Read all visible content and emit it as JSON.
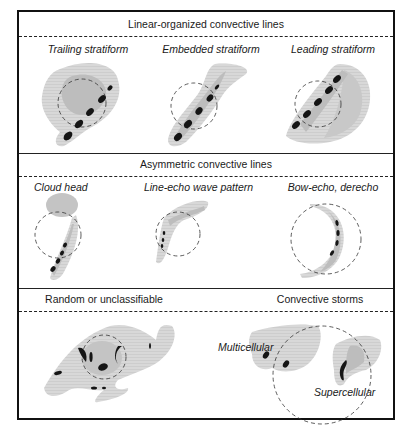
{
  "sections": [
    {
      "title": "Linear-organized convective lines",
      "panels": [
        {
          "label": "Trailing stratiform"
        },
        {
          "label": "Embedded stratiform"
        },
        {
          "label": "Leading stratiform"
        }
      ]
    },
    {
      "title": "Asymmetric convective lines",
      "panels": [
        {
          "label": "Cloud head"
        },
        {
          "label": "Line-echo wave pattern"
        },
        {
          "label": "Bow-echo, derecho"
        }
      ]
    },
    {
      "title_left": "Random or unclassifiable",
      "title_right": "Convective storms",
      "panels": [
        {
          "label": "Multicellular"
        },
        {
          "label": "Supercellular"
        }
      ]
    }
  ],
  "colors": {
    "frame": "#111111",
    "stratiform_light": "#d4d4d4",
    "stratiform_dark": "#bdbdbd",
    "convective_cell": "#151515",
    "circle": "#333333"
  }
}
